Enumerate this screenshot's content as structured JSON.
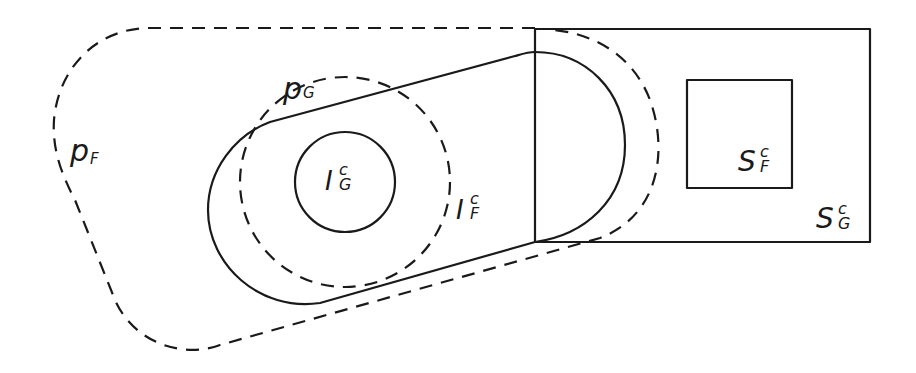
{
  "diagram": {
    "type": "set-region diagram",
    "line_color": "#1a1a1a",
    "background": "#ffffff",
    "regions": [
      {
        "id": "pF",
        "main": "p",
        "sub": "F",
        "sup": "",
        "style": "dashed",
        "shape": "rounded outer boundary"
      },
      {
        "id": "pG",
        "main": "p",
        "sub": "G",
        "sup": "",
        "style": "dashed",
        "shape": "circle"
      },
      {
        "id": "IGc",
        "main": "I",
        "sub": "G",
        "sup": "c",
        "style": "solid",
        "shape": "circle"
      },
      {
        "id": "IFc",
        "main": "I",
        "sub": "F",
        "sup": "c",
        "style": "solid",
        "shape": "stadium / capsule"
      },
      {
        "id": "SFc",
        "main": "S",
        "sub": "F",
        "sup": "c",
        "style": "solid",
        "shape": "square"
      },
      {
        "id": "SGc",
        "main": "S",
        "sub": "G",
        "sup": "c",
        "style": "solid",
        "shape": "rectangle"
      }
    ]
  }
}
